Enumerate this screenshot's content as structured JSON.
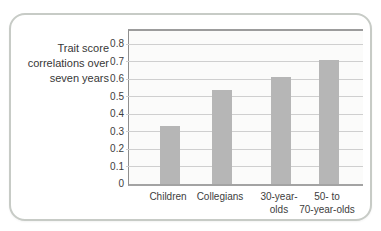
{
  "chart_data": {
    "type": "bar",
    "title": "Trait score correlations over seven years",
    "title_display": "Trait score\ncorrelations over\nseven years",
    "categories": [
      "Children",
      "Collegians",
      "30-year-olds",
      "50- to 70-year-olds"
    ],
    "category_display": [
      "Children",
      "Collegians",
      "30-year-\nolds",
      "50- to\n70-year-olds"
    ],
    "values": [
      0.33,
      0.54,
      0.61,
      0.71
    ],
    "xlabel": "",
    "ylabel": "",
    "ylim": [
      0,
      0.87
    ],
    "ytick_labels": [
      "0",
      "0.1",
      "0.2",
      "0.3",
      "0.4",
      "0.5",
      "0.6",
      "0.7",
      "0.8"
    ],
    "grid": true,
    "legend": false,
    "colors": {
      "bar": "#b6b6b6",
      "grid": "#cfcfcf",
      "axis": "#9c9c9c",
      "text": "#3d3d3d",
      "card_border": "#c7cbc6",
      "plot_bg": "#fbfbfa"
    },
    "layout": {
      "px_per_unit": 175,
      "bar_width_px": 20,
      "bar_centers_px": [
        41,
        93,
        152,
        200
      ],
      "plot_height_px": 153
    }
  }
}
